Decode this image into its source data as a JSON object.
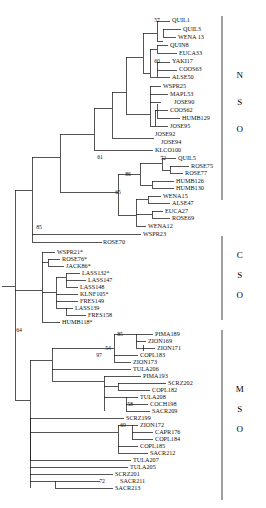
{
  "figure": {
    "type": "phylogenetic-tree",
    "width": 266,
    "height": 508,
    "background_color": "#ffffff",
    "line_color": "#1b1b1b",
    "text_color": "#111111"
  },
  "groups": [
    {
      "id": "nso",
      "letters": [
        "N",
        "S",
        "O"
      ],
      "bar_x": 222,
      "bar_top": 16,
      "bar_bottom": 200,
      "letter_x": 240,
      "letter_ys": [
        78,
        105,
        132
      ]
    },
    {
      "id": "cso",
      "letters": [
        "C",
        "S",
        "O"
      ],
      "bar_x": 222,
      "bar_top": 236,
      "bar_bottom": 320,
      "letter_x": 240,
      "letter_ys": [
        258,
        278,
        298
      ]
    },
    {
      "id": "mso",
      "letters": [
        "M",
        "S",
        "O"
      ],
      "bar_x": 222,
      "bar_top": 330,
      "bar_bottom": 500,
      "letter_x": 240,
      "letter_ys": [
        392,
        412,
        432
      ]
    }
  ],
  "taxa": [
    {
      "name": "QUIL1",
      "x": 172,
      "y": 20,
      "tip_x": 171,
      "group": "nso"
    },
    {
      "name": "QUIL3",
      "x": 183,
      "y": 29,
      "tip_x": 182,
      "group": "nso"
    },
    {
      "name": "WENA 13",
      "x": 178,
      "y": 37,
      "tip_x": 177,
      "group": "nso"
    },
    {
      "name": "QUIN8",
      "x": 170,
      "y": 45,
      "tip_x": 169,
      "group": "nso"
    },
    {
      "name": "EUCA33",
      "x": 179,
      "y": 53,
      "tip_x": 178,
      "group": "nso"
    },
    {
      "name": "YAKI17",
      "x": 172,
      "y": 61,
      "tip_x": 171,
      "group": "nso"
    },
    {
      "name": "COOS63",
      "x": 179,
      "y": 69,
      "tip_x": 178,
      "group": "nso"
    },
    {
      "name": "ALSE50",
      "x": 172,
      "y": 77,
      "tip_x": 171,
      "group": "nso"
    },
    {
      "name": "WSPR25",
      "x": 163,
      "y": 86,
      "tip_x": 162,
      "group": "nso"
    },
    {
      "name": "MAPL53",
      "x": 170,
      "y": 94,
      "tip_x": 169,
      "group": "nso"
    },
    {
      "name": "JOSE90",
      "x": 174,
      "y": 102,
      "tip_x": 173,
      "group": "nso"
    },
    {
      "name": "COOS62",
      "x": 170,
      "y": 110,
      "tip_x": 169,
      "group": "nso"
    },
    {
      "name": "HUMB129",
      "x": 182,
      "y": 118,
      "tip_x": 181,
      "group": "nso"
    },
    {
      "name": "JOSE95",
      "x": 170,
      "y": 126,
      "tip_x": 169,
      "group": "nso"
    },
    {
      "name": "JOSE92",
      "x": 155,
      "y": 134,
      "tip_x": 154,
      "group": "nso"
    },
    {
      "name": "JOSE94",
      "x": 161,
      "y": 142,
      "tip_x": 160,
      "group": "nso"
    },
    {
      "name": "KLCO100",
      "x": 155,
      "y": 150,
      "tip_x": 154,
      "group": "nso"
    },
    {
      "name": "QUIL5",
      "x": 178,
      "y": 158,
      "tip_x": 177,
      "group": "nso"
    },
    {
      "name": "ROSE75",
      "x": 191,
      "y": 166,
      "tip_x": 190,
      "group": "nso"
    },
    {
      "name": "ROSE77",
      "x": 185,
      "y": 173,
      "tip_x": 184,
      "group": "nso"
    },
    {
      "name": "HUMB126",
      "x": 176,
      "y": 181,
      "tip_x": 175,
      "group": "nso"
    },
    {
      "name": "HUMB130",
      "x": 176,
      "y": 188,
      "tip_x": 175,
      "group": "nso"
    },
    {
      "name": "WENA15",
      "x": 163,
      "y": 196,
      "tip_x": 162,
      "group": "nso"
    },
    {
      "name": "ALSE47",
      "x": 172,
      "y": 203,
      "tip_x": 171,
      "group": "nso"
    },
    {
      "name": "EUCA27",
      "x": 165,
      "y": 211,
      "tip_x": 164,
      "group": "nso"
    },
    {
      "name": "ROSE69",
      "x": 172,
      "y": 218,
      "tip_x": 171,
      "group": "nso"
    },
    {
      "name": "WENA12",
      "x": 148,
      "y": 226,
      "tip_x": 147,
      "group": "nso"
    },
    {
      "name": "WSPR23",
      "x": 143,
      "y": 234,
      "tip_x": 142,
      "group": "nso"
    },
    {
      "name": "ROSE70",
      "x": 103,
      "y": 242,
      "tip_x": 102,
      "group": "nso"
    },
    {
      "name": "WSPR21*",
      "x": 57,
      "y": 252,
      "tip_x": 56,
      "group": "cso"
    },
    {
      "name": "ROSE76*",
      "x": 62,
      "y": 259,
      "tip_x": 61,
      "group": "cso"
    },
    {
      "name": "JACK86*",
      "x": 66,
      "y": 266,
      "tip_x": 65,
      "group": "cso"
    },
    {
      "name": "LASS132*",
      "x": 82,
      "y": 273,
      "tip_x": 81,
      "group": "cso"
    },
    {
      "name": "LASS147",
      "x": 88,
      "y": 280,
      "tip_x": 87,
      "group": "cso"
    },
    {
      "name": "LASS148",
      "x": 80,
      "y": 287,
      "tip_x": 79,
      "group": "cso"
    },
    {
      "name": "KLNF105*",
      "x": 80,
      "y": 294,
      "tip_x": 79,
      "group": "cso"
    },
    {
      "name": "FRES149",
      "x": 80,
      "y": 301,
      "tip_x": 79,
      "group": "cso"
    },
    {
      "name": "LASS139",
      "x": 75,
      "y": 308,
      "tip_x": 74,
      "group": "cso"
    },
    {
      "name": "FRES158",
      "x": 88,
      "y": 315,
      "tip_x": 87,
      "group": "cso"
    },
    {
      "name": "HUMB118*",
      "x": 62,
      "y": 322,
      "tip_x": 61,
      "group": "cso"
    },
    {
      "name": "PIMA189",
      "x": 155,
      "y": 334,
      "tip_x": 154,
      "group": "mso"
    },
    {
      "name": "ZION169",
      "x": 148,
      "y": 341,
      "tip_x": 147,
      "group": "mso"
    },
    {
      "name": "ZION171",
      "x": 157,
      "y": 348,
      "tip_x": 156,
      "group": "mso"
    },
    {
      "name": "COPL183",
      "x": 140,
      "y": 355,
      "tip_x": 139,
      "group": "mso"
    },
    {
      "name": "ZION173",
      "x": 133,
      "y": 362,
      "tip_x": 132,
      "group": "mso"
    },
    {
      "name": "TULA206",
      "x": 133,
      "y": 369,
      "tip_x": 132,
      "group": "mso"
    },
    {
      "name": "PIMA193",
      "x": 143,
      "y": 376,
      "tip_x": 142,
      "group": "mso"
    },
    {
      "name": "SCRZ202",
      "x": 168,
      "y": 383,
      "tip_x": 167,
      "group": "mso"
    },
    {
      "name": "COPL182",
      "x": 152,
      "y": 390,
      "tip_x": 151,
      "group": "mso"
    },
    {
      "name": "TULA208",
      "x": 140,
      "y": 397,
      "tip_x": 139,
      "group": "mso"
    },
    {
      "name": "COCH198",
      "x": 150,
      "y": 404,
      "tip_x": 149,
      "group": "mso"
    },
    {
      "name": "SACR209",
      "x": 152,
      "y": 411,
      "tip_x": 151,
      "group": "mso"
    },
    {
      "name": "SCRZ199",
      "x": 126,
      "y": 418,
      "tip_x": 125,
      "group": "mso"
    },
    {
      "name": "ZION172",
      "x": 140,
      "y": 425,
      "tip_x": 139,
      "group": "mso"
    },
    {
      "name": "CAPR176",
      "x": 155,
      "y": 432,
      "tip_x": 154,
      "group": "mso"
    },
    {
      "name": "COPL184",
      "x": 155,
      "y": 439,
      "tip_x": 154,
      "group": "mso"
    },
    {
      "name": "COPL185",
      "x": 140,
      "y": 446,
      "tip_x": 139,
      "group": "mso"
    },
    {
      "name": "SACR212",
      "x": 150,
      "y": 453,
      "tip_x": 149,
      "group": "mso"
    },
    {
      "name": "TULA207",
      "x": 133,
      "y": 460,
      "tip_x": 132,
      "group": "mso"
    },
    {
      "name": "TULA205",
      "x": 130,
      "y": 467,
      "tip_x": 129,
      "group": "mso"
    },
    {
      "name": "SCRZ201",
      "x": 115,
      "y": 474,
      "tip_x": 114,
      "group": "mso"
    },
    {
      "name": "SACR211",
      "x": 120,
      "y": 481,
      "tip_x": 119,
      "group": "mso"
    },
    {
      "name": "SACR213",
      "x": 115,
      "y": 488,
      "tip_x": 114,
      "group": "mso"
    }
  ],
  "bootstrap_values": [
    {
      "value": "57",
      "x": 160,
      "y": 20
    },
    {
      "value": "60",
      "x": 160,
      "y": 61
    },
    {
      "value": "61",
      "x": 103,
      "y": 157
    },
    {
      "value": "72",
      "x": 166,
      "y": 158
    },
    {
      "value": "86",
      "x": 131,
      "y": 174
    },
    {
      "value": "65",
      "x": 121,
      "y": 192
    },
    {
      "value": "85",
      "x": 42,
      "y": 227
    },
    {
      "value": "85",
      "x": 123,
      "y": 334
    },
    {
      "value": "54",
      "x": 111,
      "y": 348
    },
    {
      "value": "97",
      "x": 102,
      "y": 355
    },
    {
      "value": "58",
      "x": 133,
      "y": 404
    },
    {
      "value": "69",
      "x": 126,
      "y": 425
    },
    {
      "value": "72",
      "x": 105,
      "y": 481
    },
    {
      "value": "64",
      "x": 22,
      "y": 330
    }
  ],
  "nodes": [
    {
      "id": "root",
      "x": 15,
      "y_top": 227,
      "y_bot": 400
    },
    {
      "id": "nso-root",
      "x": 32,
      "y_top": 191,
      "y_bot": 242
    },
    {
      "id": "cso-root",
      "x": 42,
      "y_top": 266,
      "y_bot": 322
    },
    {
      "id": "mso-root",
      "x": 52,
      "y_top": 381,
      "y_bot": 481
    }
  ]
}
